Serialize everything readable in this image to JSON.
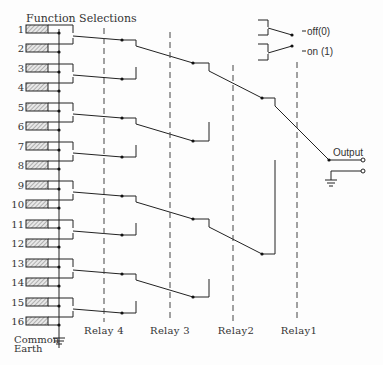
{
  "title": "Function Selections",
  "rows": [
    "1",
    "2",
    "3",
    "4",
    "5",
    "6",
    "7",
    "8",
    "9",
    "10",
    "11",
    "12",
    "13",
    "14",
    "15",
    "16"
  ],
  "relays": [
    {
      "label": "Relay 4",
      "x": 104
    },
    {
      "label": "Relay 3",
      "x": 170
    },
    {
      "label": "Relay2",
      "x": 233
    },
    {
      "label": "Relay1",
      "x": 297
    }
  ],
  "legend": {
    "off": "off(0)",
    "on": "on (1)"
  },
  "output_label": "Output",
  "earth_label_line1": "Common",
  "earth_label_line2": "Earth",
  "colors": {
    "line": "#222222",
    "background": "#fdfdfd",
    "text": "#333333"
  }
}
